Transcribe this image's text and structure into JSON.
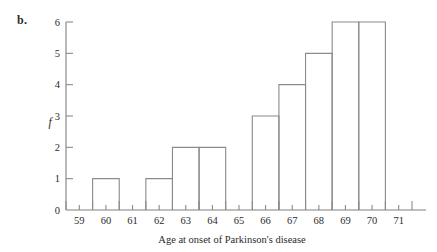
{
  "figure": {
    "panel_label": "b."
  },
  "chart_data": {
    "type": "bar",
    "title": "",
    "xlabel": "Age at onset of Parkinson's disease",
    "ylabel": "f",
    "categories": [
      "59",
      "60",
      "61",
      "62",
      "63",
      "64",
      "65",
      "66",
      "67",
      "68",
      "69",
      "70",
      "71"
    ],
    "values": [
      0,
      1,
      0,
      1,
      2,
      2,
      0,
      3,
      4,
      5,
      6,
      6,
      0
    ],
    "xtick_labels": [
      "59",
      "60",
      "61",
      "62",
      "63",
      "64",
      "65",
      "66",
      "67",
      "68",
      "69",
      "70",
      "71"
    ],
    "ytick_labels": [
      "0",
      "1",
      "2",
      "3",
      "4",
      "5",
      "6"
    ],
    "ytick_values": [
      0,
      1,
      2,
      3,
      4,
      5,
      6
    ],
    "ylim": [
      0,
      6
    ],
    "xlim": [
      58.5,
      71.5
    ],
    "bin_width": 1,
    "bin_edges": [
      58.5,
      59.5,
      60.5,
      61.5,
      62.5,
      63.5,
      64.5,
      65.5,
      66.5,
      67.5,
      68.5,
      69.5,
      70.5,
      71.5
    ],
    "grid": false,
    "legend": false,
    "line_color": "#8a8a8a",
    "text_color": "#2b2b2b",
    "bar_fill": "none"
  }
}
